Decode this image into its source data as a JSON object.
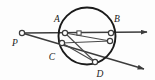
{
  "figure": {
    "background_color": "#fdfdfd",
    "stroke_color": "#3c3c3c",
    "circle_stroke_color": "#1a1a1a",
    "label_color": "#1a1a1a",
    "marker_fill": "#ffffff",
    "circle": {
      "cx": 87,
      "cy": 36,
      "r": 28.5,
      "stroke_width": 1.9
    },
    "labels": [
      {
        "id": "label-P",
        "text": "P",
        "x": 15,
        "y": 46
      },
      {
        "id": "label-A",
        "text": "A",
        "x": 57,
        "y": 22
      },
      {
        "id": "label-B",
        "text": "B",
        "x": 117,
        "y": 22
      },
      {
        "id": "label-C",
        "text": "C",
        "x": 52,
        "y": 60
      },
      {
        "id": "label-D",
        "text": "D",
        "x": 100,
        "y": 77
      }
    ],
    "points": [
      {
        "id": "point-P",
        "label": "P",
        "x": 22,
        "y": 33,
        "r": 2.6,
        "on_circle": false
      },
      {
        "id": "point-A",
        "label": "A",
        "x": 65,
        "y": 33,
        "r": 2.6,
        "on_circle": true
      },
      {
        "id": "point-B",
        "label": "B",
        "x": 111,
        "y": 33,
        "r": 2.6,
        "on_circle": true
      },
      {
        "id": "point-C",
        "label": "C",
        "x": 62,
        "y": 43,
        "r": 2.6,
        "on_circle": true
      },
      {
        "id": "point-D",
        "label": "D",
        "x": 95,
        "y": 62,
        "r": 2.6,
        "on_circle": true
      },
      {
        "id": "point-E",
        "label": "",
        "x": 110,
        "y": 41,
        "r": 2.6,
        "on_circle": true
      }
    ],
    "intersection_marker": {
      "id": "chord-intersection",
      "x": 79,
      "y": 33,
      "size": 4.2
    },
    "rays": [
      {
        "id": "ray-upper-secant",
        "from": "P",
        "through": [
          "A",
          "B"
        ],
        "x1": 22,
        "y1": 33,
        "x2": 147,
        "y2": 32,
        "has_arrow": true
      },
      {
        "id": "ray-lower-secant",
        "from": "P",
        "through": [
          "C",
          "D"
        ],
        "x1": 22,
        "y1": 33,
        "x2": 144,
        "y2": 69,
        "has_arrow": true
      }
    ],
    "chords": [
      {
        "id": "chord-A-D",
        "from": "A",
        "to": "D",
        "x1": 65,
        "y1": 33,
        "x2": 95,
        "y2": 62
      },
      {
        "id": "chord-C-E",
        "from": "C",
        "to": "E",
        "x1": 62,
        "y1": 43,
        "x2": 110,
        "y2": 41
      },
      {
        "id": "chord-C-D",
        "from": "C",
        "to": "D",
        "x1": 62,
        "y1": 43,
        "x2": 95,
        "y2": 62
      },
      {
        "id": "chord-A-E",
        "from": "A",
        "to": "E",
        "x1": 65,
        "y1": 33,
        "x2": 110,
        "y2": 41
      }
    ]
  }
}
